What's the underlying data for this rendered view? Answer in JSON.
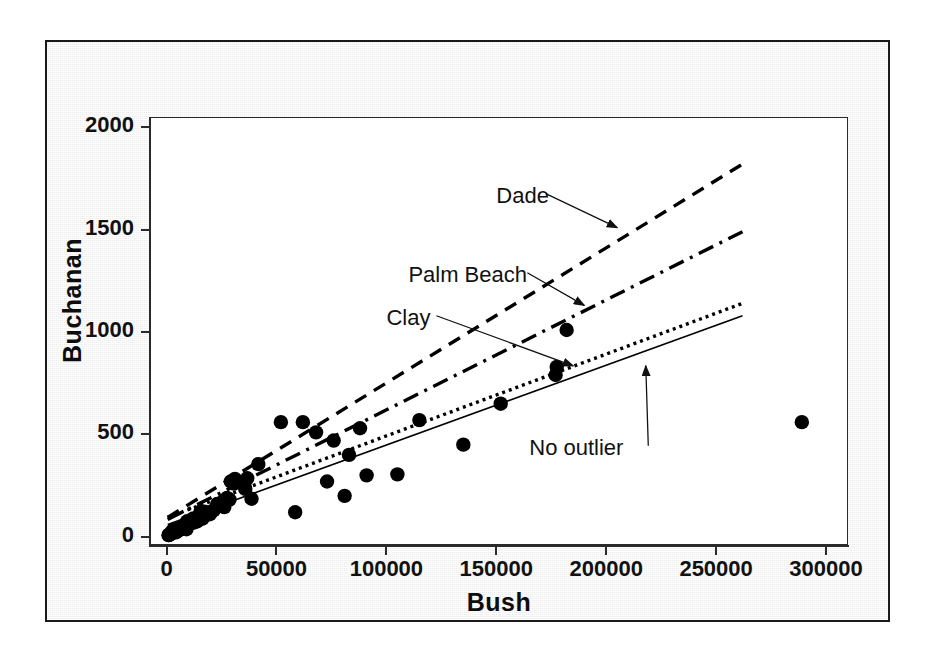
{
  "chart_data": {
    "type": "scatter",
    "title": "",
    "xlabel": "Bush",
    "ylabel": "Buchanan",
    "xlim": [
      -8000,
      310000
    ],
    "ylim": [
      -40,
      2050
    ],
    "xticks": [
      0,
      50000,
      100000,
      150000,
      200000,
      250000,
      300000
    ],
    "xtick_labels": [
      "0",
      "50000",
      "100000",
      "150000",
      "200000",
      "250000",
      "300000"
    ],
    "yticks": [
      0,
      500,
      1000,
      1500,
      2000
    ],
    "ytick_labels": [
      "0",
      "500",
      "1000",
      "1500",
      "2000"
    ],
    "grid": false,
    "legend_position": "none",
    "marker": "filled-circle",
    "marker_color": "#000000",
    "points": [
      [
        1316,
        10
      ],
      [
        2873,
        23
      ],
      [
        35426,
        262
      ],
      [
        29744,
        270
      ],
      [
        38637,
        186
      ],
      [
        16404,
        90
      ],
      [
        6443,
        37
      ],
      [
        2646,
        29
      ],
      [
        41745,
        355
      ],
      [
        16101,
        89
      ],
      [
        5414,
        39
      ],
      [
        28635,
        182
      ],
      [
        26237,
        145
      ],
      [
        29190,
        270
      ],
      [
        4256,
        22
      ],
      [
        6151,
        38
      ],
      [
        10395,
        68
      ],
      [
        9048,
        37
      ],
      [
        5050,
        29
      ],
      [
        2326,
        17
      ],
      [
        12173,
        69
      ],
      [
        4985,
        30
      ],
      [
        4511,
        36
      ],
      [
        9348,
        76
      ],
      [
        12126,
        78
      ],
      [
        25249,
        152
      ],
      [
        4256,
        26
      ],
      [
        3038,
        24
      ],
      [
        13891,
        75
      ],
      [
        17221,
        123
      ],
      [
        35805,
        234
      ],
      [
        3137,
        33
      ],
      [
        15461,
        122
      ],
      [
        20190,
        120
      ],
      [
        18850,
        117
      ],
      [
        14630,
        98
      ],
      [
        30646,
        260
      ],
      [
        33864,
        267
      ],
      [
        31100,
        283
      ],
      [
        36700,
        286
      ],
      [
        4994,
        30
      ],
      [
        8077,
        46
      ],
      [
        7572,
        51
      ],
      [
        5610,
        33
      ],
      [
        7101,
        43
      ],
      [
        8960,
        63
      ],
      [
        1010,
        9
      ],
      [
        12176,
        90
      ],
      [
        19696,
        110
      ],
      [
        21431,
        130
      ],
      [
        23000,
        160
      ],
      [
        25800,
        175
      ],
      [
        27500,
        190
      ],
      [
        3600,
        28
      ],
      [
        2400,
        20
      ],
      [
        1800,
        14
      ],
      [
        900,
        8
      ],
      [
        6900,
        45
      ],
      [
        11200,
        70
      ],
      [
        13400,
        85
      ],
      [
        52000,
        560
      ],
      [
        62000,
        560
      ],
      [
        58500,
        120
      ],
      [
        68000,
        510
      ],
      [
        73000,
        270
      ],
      [
        76000,
        470
      ],
      [
        81000,
        200
      ],
      [
        83000,
        400
      ],
      [
        88000,
        530
      ],
      [
        91000,
        300
      ],
      [
        105000,
        305
      ],
      [
        115000,
        570
      ],
      [
        135000,
        450
      ],
      [
        152000,
        650
      ],
      [
        177000,
        790
      ],
      [
        177500,
        830
      ],
      [
        182000,
        1010
      ],
      [
        289000,
        560
      ]
    ],
    "lines": [
      {
        "name": "Dade",
        "style": "dashed",
        "color": "#000000",
        "x": [
          500,
          262000
        ],
        "y": [
          95,
          1820
        ],
        "slope_note": "steepest fitted line"
      },
      {
        "name": "Palm Beach",
        "style": "dash-dot",
        "color": "#000000",
        "x": [
          500,
          262000
        ],
        "y": [
          85,
          1490
        ]
      },
      {
        "name": "Clay",
        "style": "dotted",
        "color": "#000000",
        "x": [
          500,
          262000
        ],
        "y": [
          95,
          1140
        ]
      },
      {
        "name": "No outlier",
        "style": "solid",
        "color": "#000000",
        "x": [
          500,
          262000
        ],
        "y": [
          60,
          1080
        ]
      }
    ],
    "annotations": [
      {
        "text": "Dade",
        "label_x": 150000,
        "label_y": 1655,
        "arrow_to_x": 205000,
        "arrow_to_y": 1510
      },
      {
        "text": "Palm Beach",
        "label_x": 110000,
        "label_y": 1270,
        "arrow_to_x": 190000,
        "arrow_to_y": 1130
      },
      {
        "text": "Clay",
        "label_x": 100000,
        "label_y": 1060,
        "arrow_to_x": 185000,
        "arrow_to_y": 835
      },
      {
        "text": "No outlier",
        "label_x": 165000,
        "label_y": 425,
        "arrow_to_x": 218000,
        "arrow_to_y": 835
      }
    ]
  },
  "axes": {
    "x_title": "Bush",
    "y_title": "Buchanan"
  },
  "colors": {
    "figure_background": "#ededed",
    "plot_background": "#ffffff",
    "axis": "#2b2b2b",
    "marker": "#000000",
    "text": "#111111",
    "border": "#1a1a1a"
  }
}
